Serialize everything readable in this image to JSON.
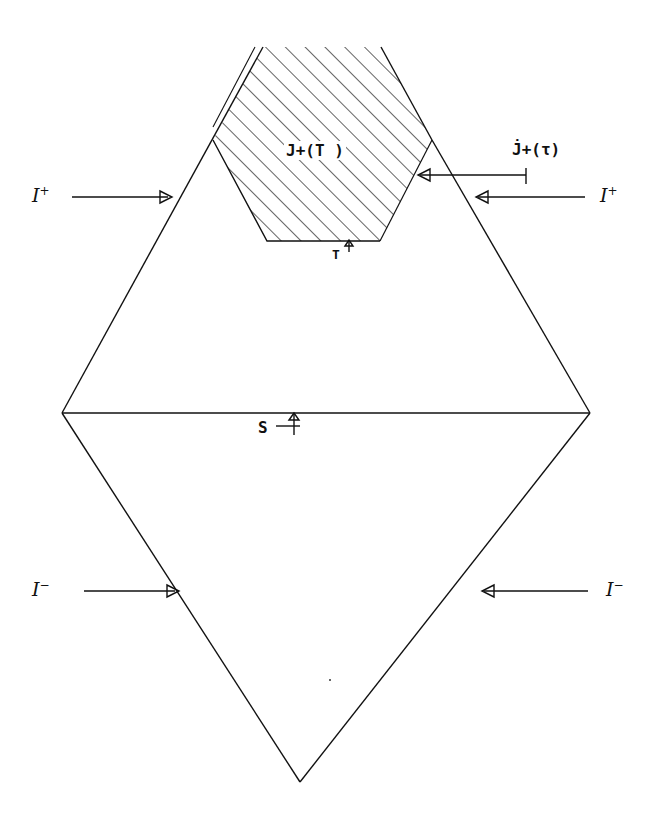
{
  "diagram": {
    "type": "Penrose (conformal) diagram",
    "labels": {
      "scri_plus_left": {
        "base": "I",
        "sup": "+"
      },
      "scri_plus_right": {
        "base": "I",
        "sup": "+"
      },
      "scri_minus_left": {
        "base": "I",
        "sup": "−"
      },
      "scri_minus_right": {
        "base": "I",
        "sup": "−"
      },
      "region": "J+(T )",
      "boundary": "J̇+(τ)",
      "surface_T": "T",
      "surface_S": "S"
    },
    "shapes": {
      "diamond": {
        "top_left_edge_end": [
          263,
          47
        ],
        "left": [
          62,
          413
        ],
        "right": [
          590,
          413
        ],
        "bottom": [
          300,
          782
        ]
      },
      "hexagon_hatched": [
        "213,140",
        "263,47",
        "381,47",
        "432,140",
        "380,241",
        "267,241"
      ],
      "spacelike_surface_S": {
        "from": [
          62,
          413
        ],
        "to": [
          590,
          413
        ]
      },
      "colors": {
        "ink": "#111111",
        "background": "#ffffff"
      }
    }
  }
}
